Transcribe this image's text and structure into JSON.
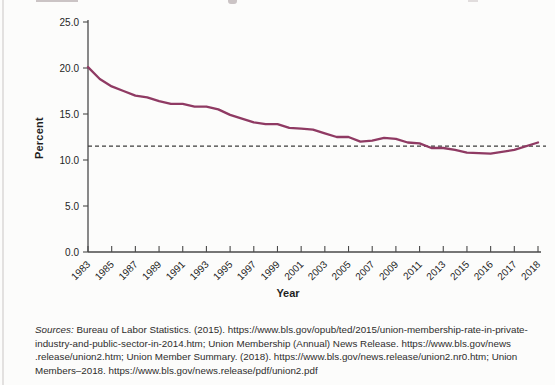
{
  "chart_data": {
    "type": "line",
    "title": "",
    "xlabel": "Year",
    "ylabel": "Percent",
    "ylim": [
      0,
      25
    ],
    "y_ticks": [
      25,
      20,
      15,
      10,
      5,
      0
    ],
    "y_tick_format": "one-decimal",
    "x_tick_labels": [
      "1983",
      "1985",
      "1987",
      "1989",
      "1991",
      "1993",
      "1995",
      "1997",
      "1999",
      "2001",
      "2003",
      "2005",
      "2007",
      "2009",
      "2011",
      "2013",
      "2015",
      "2016",
      "2017",
      "2018"
    ],
    "grid": false,
    "legend": "none",
    "line_color": "#8f3a63",
    "reference_line": {
      "value": 11.5,
      "style": "dashed",
      "color": "#3d3d3d"
    },
    "axis_color": "#4a4a4a",
    "series": [
      {
        "name": "",
        "x": [
          1983,
          1984,
          1985,
          1986,
          1987,
          1988,
          1989,
          1990,
          1991,
          1992,
          1993,
          1994,
          1995,
          1996,
          1997,
          1998,
          1999,
          2000,
          2001,
          2002,
          2003,
          2004,
          2005,
          2006,
          2007,
          2008,
          2009,
          2010,
          2011,
          2012,
          2013,
          2014,
          2015,
          2016,
          2017,
          2018
        ],
        "values": [
          20.1,
          18.8,
          18.0,
          17.5,
          17.0,
          16.8,
          16.4,
          16.1,
          16.1,
          15.8,
          15.8,
          15.5,
          14.9,
          14.5,
          14.1,
          13.9,
          13.9,
          13.5,
          13.4,
          13.3,
          12.9,
          12.5,
          12.5,
          12.0,
          12.1,
          12.4,
          12.3,
          11.9,
          11.8,
          11.3,
          11.3,
          11.1,
          10.8,
          10.7,
          11.1,
          11.9
        ]
      }
    ]
  },
  "sources": {
    "prefix": "Sources:",
    "line1_rest": " Bureau of Labor Statistics. (2015). https://www.bls.gov/opub/ted/2015/union-membership-rate-in-private-",
    "line2": "industry-and-public-sector-in-2014.htm; Union Membership (Annual) News Release. https://www.bls.gov/news",
    "line3": ".release/union2.htm; Union Member Summary. (2018). https://www.bls.gov/news.release/union2.nr0.htm; Union",
    "line4": "Members–2018. https://www.bls.gov/news.release/pdf/union2.pdf"
  }
}
